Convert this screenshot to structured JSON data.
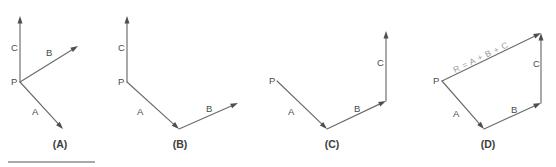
{
  "figure": {
    "background_color": "#ffffff",
    "line_color": "#6b6b6b",
    "arrow_color": "#4f4f4f",
    "label_color": "#4a4a4a",
    "caption_color": "#3d3d3d",
    "resultant_color": "#9a9a9a",
    "rule_color": "#8e8e8e"
  },
  "panels": [
    {
      "id": "panel-a",
      "caption": "(A)",
      "caption_x": 60,
      "caption_y": 148,
      "origin_label": "P",
      "origin_label_x": 11,
      "origin_label_y": 85,
      "vectors": [
        {
          "name": "C",
          "x1": 20,
          "y1": 82,
          "x2": 20,
          "y2": 16,
          "label": "C",
          "label_x": 11,
          "label_y": 51
        },
        {
          "name": "B",
          "x1": 20,
          "y1": 82,
          "x2": 78,
          "y2": 46,
          "label": "B",
          "label_x": 46,
          "label_y": 56
        },
        {
          "name": "A",
          "x1": 20,
          "y1": 82,
          "x2": 63,
          "y2": 129,
          "label": "A",
          "label_x": 32,
          "label_y": 115
        }
      ]
    },
    {
      "id": "panel-b",
      "caption": "(B)",
      "caption_x": 180,
      "caption_y": 148,
      "origin_label": "P",
      "origin_label_x": 118,
      "origin_label_y": 85,
      "vectors": [
        {
          "name": "C",
          "x1": 127,
          "y1": 82,
          "x2": 127,
          "y2": 16,
          "label": "C",
          "label_x": 118,
          "label_y": 51
        },
        {
          "name": "A",
          "x1": 127,
          "y1": 82,
          "x2": 179,
          "y2": 129,
          "label": "A",
          "label_x": 137,
          "label_y": 115
        },
        {
          "name": "B",
          "x1": 179,
          "y1": 129,
          "x2": 238,
          "y2": 103,
          "label": "B",
          "label_x": 206,
          "label_y": 112
        }
      ]
    },
    {
      "id": "panel-c",
      "caption": "(C)",
      "caption_x": 332,
      "caption_y": 148,
      "origin_label": "P",
      "origin_label_x": 269,
      "origin_label_y": 84,
      "vectors": [
        {
          "name": "A",
          "x1": 277,
          "y1": 81,
          "x2": 327,
          "y2": 129,
          "label": "A",
          "label_x": 288,
          "label_y": 115
        },
        {
          "name": "B",
          "x1": 327,
          "y1": 129,
          "x2": 386,
          "y2": 101,
          "label": "B",
          "label_x": 354,
          "label_y": 112
        },
        {
          "name": "C",
          "x1": 386,
          "y1": 101,
          "x2": 386,
          "y2": 31,
          "label": "C",
          "label_x": 377,
          "label_y": 66
        }
      ]
    },
    {
      "id": "panel-d",
      "caption": "(D)",
      "caption_x": 488,
      "caption_y": 148,
      "origin_label": "P",
      "origin_label_x": 433,
      "origin_label_y": 84,
      "vectors": [
        {
          "name": "A",
          "x1": 442,
          "y1": 81,
          "x2": 484,
          "y2": 129,
          "label": "A",
          "label_x": 453,
          "label_y": 117
        },
        {
          "name": "B",
          "x1": 484,
          "y1": 129,
          "x2": 541,
          "y2": 103,
          "label": "B",
          "label_x": 511,
          "label_y": 113
        },
        {
          "name": "C",
          "x1": 541,
          "y1": 103,
          "x2": 541,
          "y2": 33,
          "label": "C",
          "label_x": 533,
          "label_y": 67
        }
      ],
      "resultant": {
        "name": "R",
        "x1": 442,
        "y1": 81,
        "x2": 541,
        "y2": 33,
        "label": "R = A + B + C",
        "label_x": 455,
        "label_y": 73,
        "label_rotation": -25.9
      }
    }
  ],
  "rule": {
    "x1": 8,
    "y1": 162,
    "x2": 95,
    "y2": 162
  }
}
